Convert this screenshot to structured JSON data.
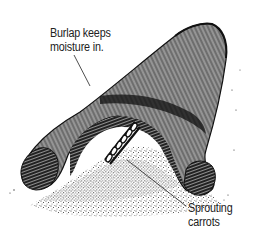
{
  "illustration": {
    "subject": "burlap-covered mound with sprouting carrots",
    "colors": {
      "ink": "#111111",
      "background": "#ffffff",
      "label_text": "#222222"
    }
  },
  "callouts": {
    "burlap": {
      "line1": "Burlap keeps",
      "line2": "moisture in."
    },
    "carrots": {
      "line1": "Sprouting",
      "line2": "carrots"
    }
  }
}
